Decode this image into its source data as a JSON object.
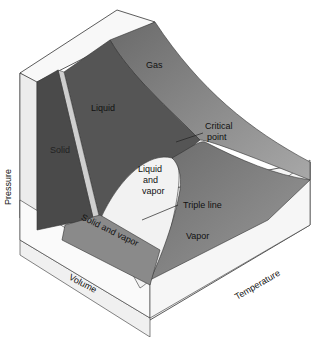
{
  "diagram": {
    "regions": {
      "gas": "Gas",
      "liquid": "Liquid",
      "solid": "Solid",
      "liquid_vapor_1": "Liquid",
      "liquid_vapor_2": "and",
      "liquid_vapor_3": "vapor",
      "solid_vapor": "Solid and vapor",
      "vapor": "Vapor"
    },
    "annotations": {
      "critical_1": "Critical",
      "critical_2": "point",
      "triple_line": "Triple line"
    },
    "axes": {
      "pressure": "Pressure",
      "volume": "Volume",
      "temperature": "Temperature"
    }
  }
}
